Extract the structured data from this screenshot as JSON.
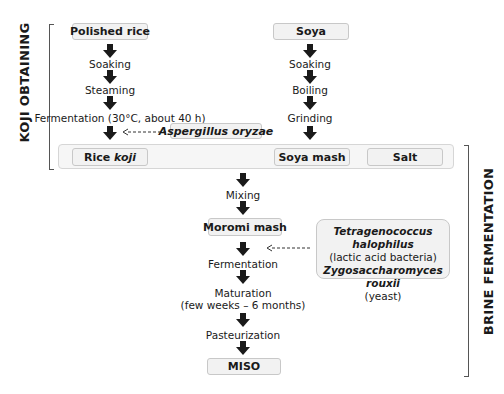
{
  "sections": {
    "koji": "KOJI OBTAINING",
    "brine": "BRINE FERMENTATION"
  },
  "rice_branch": {
    "start": "Polished rice",
    "steps": [
      "Soaking",
      "Steaming",
      "Fermentation (30°C, about 40 h)"
    ],
    "product_prefix": "Rice ",
    "product_italic": "koji"
  },
  "soya_branch": {
    "start": "Soya",
    "steps": [
      "Soaking",
      "Boiling",
      "Grinding"
    ],
    "product": "Soya mash"
  },
  "salt": "Salt",
  "koji_microorganism": "Aspergillus oryzae",
  "main_flow": {
    "mixing": "Mixing",
    "moromi": "Moromi mash",
    "fermentation": "Fermentation",
    "maturation": "Maturation",
    "maturation_time": "(few weeks – 6 months)",
    "pasteurization": "Pasteurization",
    "final": "MISO"
  },
  "brine_microorganisms": {
    "bacteria_name": "Tetragenococcus halophilus",
    "bacteria_type": "(lactic acid bacteria)",
    "yeast_name": "Zygosaccharomyces rouxii",
    "yeast_type": "(yeast)"
  },
  "colors": {
    "box_fill": "#f2f2f2",
    "box_border": "#c8c8c8",
    "arrow": "#1a1a1a",
    "bracket": "#555555"
  }
}
